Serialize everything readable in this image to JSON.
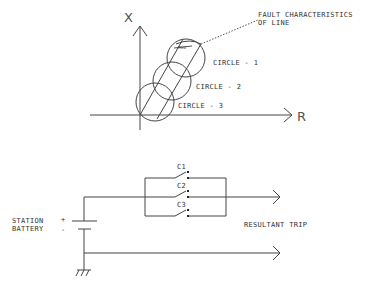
{
  "diagram": {
    "top": {
      "axes": {
        "x_label": "R",
        "y_label": "X"
      },
      "annotation": {
        "line1": "FAULT CHARACTERISTICS",
        "line2": "OF LINE",
        "small_label": "MHO"
      },
      "circles": [
        {
          "label": "CIRCLE - 1",
          "cx": 186,
          "cy": 58,
          "r": 19
        },
        {
          "label": "CIRCLE - 2",
          "cx": 172,
          "cy": 81,
          "r": 19
        },
        {
          "label": "CIRCLE - 3",
          "cx": 155,
          "cy": 102,
          "r": 19
        }
      ]
    },
    "bottom": {
      "battery": {
        "label_line1": "STATION",
        "label_line2": "BATTERY",
        "plus": "+",
        "minus": "-"
      },
      "contacts": [
        {
          "label": "C1"
        },
        {
          "label": "C2"
        },
        {
          "label": "C3"
        }
      ],
      "output_label": "RESULTANT TRIP"
    }
  }
}
